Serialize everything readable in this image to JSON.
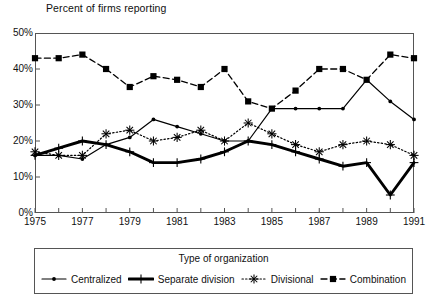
{
  "chart_data": {
    "type": "line",
    "title": "Percent of firms reporting",
    "xlabel": "",
    "ylabel": "",
    "grid": false,
    "legend_position": "bottom",
    "legend_title": "Type of organization",
    "xlim": [
      1975,
      1991
    ],
    "ylim": [
      0,
      50
    ],
    "ytick_labels": [
      "50%",
      "40%",
      "30%",
      "20%",
      "10%",
      "0%"
    ],
    "ytick_values": [
      50,
      40,
      30,
      20,
      10,
      0
    ],
    "xtick_labels": [
      "1975",
      "1977",
      "1979",
      "1981",
      "1983",
      "1985",
      "1987",
      "1989",
      "1991"
    ],
    "xtick_values": [
      1975,
      1977,
      1979,
      1981,
      1983,
      1985,
      1987,
      1989,
      1991
    ],
    "x": [
      1975,
      1976,
      1977,
      1978,
      1979,
      1980,
      1981,
      1982,
      1983,
      1984,
      1985,
      1986,
      1987,
      1988,
      1989,
      1990,
      1991
    ],
    "series": [
      {
        "name": "Centralized",
        "marker": "dot",
        "style": "solid-thin",
        "values": [
          16,
          16,
          15,
          19,
          21,
          26,
          24,
          22,
          20,
          20,
          29,
          29,
          29,
          29,
          37,
          31,
          26
        ]
      },
      {
        "name": "Separate division",
        "marker": "plus",
        "style": "solid-thick",
        "values": [
          16,
          18,
          20,
          19,
          17,
          14,
          14,
          15,
          17,
          20,
          19,
          17,
          15,
          13,
          14,
          5,
          14
        ]
      },
      {
        "name": "Divisional",
        "marker": "asterisk",
        "style": "dotted",
        "values": [
          17,
          16,
          16,
          22,
          23,
          20,
          21,
          23,
          20,
          25,
          22,
          19,
          17,
          19,
          20,
          19,
          16
        ]
      },
      {
        "name": "Combination",
        "marker": "square",
        "style": "dashed",
        "values": [
          43,
          43,
          44,
          40,
          35,
          38,
          37,
          35,
          40,
          31,
          29,
          34,
          40,
          40,
          37,
          44,
          43
        ]
      }
    ]
  },
  "legend": {
    "title": "Type of organization",
    "items": [
      {
        "label": "Centralized",
        "icon": "line-dot-marker-icon"
      },
      {
        "label": "Separate division",
        "icon": "plus-marker-icon"
      },
      {
        "label": "Divisional",
        "icon": "asterisk-marker-icon"
      },
      {
        "label": "Combination",
        "icon": "square-marker-icon"
      }
    ]
  }
}
